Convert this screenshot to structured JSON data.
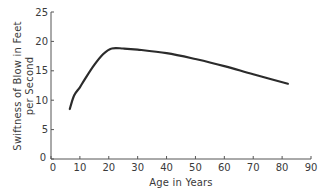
{
  "chart_data": {
    "type": "line",
    "title": "",
    "xlabel": "Age in Years",
    "ylabel": [
      "Swiftness of Blow in Feet",
      "per Second"
    ],
    "xlim": [
      0,
      90
    ],
    "ylim": [
      0,
      25
    ],
    "xticks": [
      0,
      10,
      20,
      30,
      40,
      50,
      60,
      70,
      80,
      90
    ],
    "yticks": [
      0,
      5,
      10,
      15,
      20,
      25
    ],
    "grid": false,
    "legend": null,
    "series": [
      {
        "name": "Swiftness of blow",
        "x": [
          6.5,
          8,
          10,
          12,
          15,
          18,
          21,
          25,
          30,
          40,
          50,
          60,
          70,
          82
        ],
        "y": [
          8.5,
          10.8,
          12.2,
          13.8,
          16.0,
          17.8,
          18.8,
          18.8,
          18.6,
          18.0,
          17.0,
          15.8,
          14.4,
          12.8
        ]
      }
    ],
    "colors": {
      "line": "#2b2b2b",
      "axis": "#555555",
      "text": "#3a3a3a"
    }
  }
}
